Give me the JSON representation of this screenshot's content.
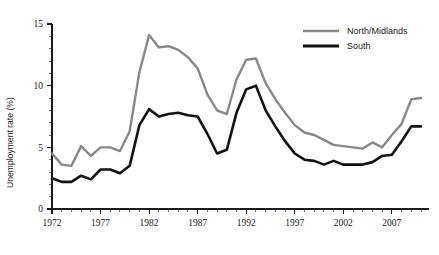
{
  "chart_data": {
    "type": "line",
    "title": "",
    "subtitle": "",
    "xlabel": "",
    "ylabel": "Unemployment rate (%)",
    "xlim": [
      1972,
      2010
    ],
    "ylim": [
      0,
      15
    ],
    "grid": false,
    "legend_position": "top-right",
    "x_major_ticks": [
      1972,
      1977,
      1982,
      1987,
      1992,
      1997,
      2002,
      2007
    ],
    "x_tick_labels": [
      "1972",
      "1977",
      "1982",
      "1987",
      "1992",
      "1997",
      "2002",
      "2007"
    ],
    "x_minor_tick_step": 1,
    "y_major_ticks": [
      0,
      5,
      10,
      15
    ],
    "y_tick_labels": [
      "0",
      "5",
      "10",
      "15"
    ],
    "y_minor_tick_step": 1,
    "x": [
      1972,
      1973,
      1974,
      1975,
      1976,
      1977,
      1978,
      1979,
      1980,
      1981,
      1982,
      1983,
      1984,
      1985,
      1986,
      1987,
      1988,
      1989,
      1990,
      1991,
      1992,
      1993,
      1994,
      1995,
      1996,
      1997,
      1998,
      1999,
      2000,
      2001,
      2002,
      2003,
      2004,
      2005,
      2006,
      2007,
      2008,
      2009,
      2010
    ],
    "series": [
      {
        "name": "North/Midlands",
        "color": "#888888",
        "line_width": 2.4,
        "values": [
          4.5,
          3.6,
          3.5,
          5.1,
          4.3,
          5.0,
          5.0,
          4.7,
          6.3,
          11.1,
          14.1,
          13.1,
          13.2,
          12.9,
          12.3,
          11.4,
          9.3,
          8.0,
          7.7,
          10.5,
          12.1,
          12.2,
          10.2,
          8.9,
          7.8,
          6.8,
          6.2,
          6.0,
          5.6,
          5.2,
          5.1,
          5.0,
          4.9,
          5.4,
          5.0,
          6.0,
          6.9,
          8.9,
          9.0
        ]
      },
      {
        "name": "South",
        "color": "#111111",
        "line_width": 2.6,
        "values": [
          2.5,
          2.2,
          2.2,
          2.7,
          2.4,
          3.2,
          3.2,
          2.9,
          3.5,
          6.8,
          8.1,
          7.5,
          7.7,
          7.8,
          7.6,
          7.5,
          6.1,
          4.5,
          4.8,
          7.8,
          9.7,
          10.0,
          8.0,
          6.7,
          5.5,
          4.5,
          4.0,
          3.9,
          3.6,
          3.9,
          3.6,
          3.6,
          3.6,
          3.8,
          4.3,
          4.4,
          5.5,
          6.7,
          6.7
        ]
      }
    ],
    "legend": [
      {
        "label": "North/Midlands",
        "color": "#888888"
      },
      {
        "label": "South",
        "color": "#111111"
      }
    ]
  }
}
